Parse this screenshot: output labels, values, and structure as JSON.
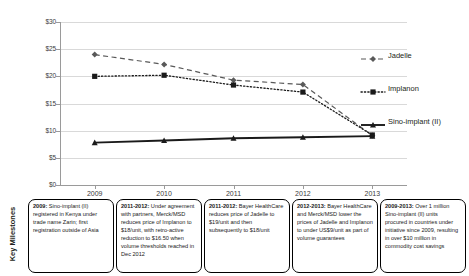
{
  "chart_data": {
    "type": "line",
    "title": "",
    "xlabel": "",
    "ylabel": "",
    "categories": [
      "2009",
      "2010",
      "2011",
      "2012",
      "2013"
    ],
    "ylim": [
      0,
      30
    ],
    "ytick_labels": [
      "$0",
      "$5",
      "$10",
      "$15",
      "$20",
      "$25",
      "$30"
    ],
    "ytick_values": [
      0,
      5,
      10,
      15,
      20,
      25,
      30
    ],
    "grid": true,
    "legend_position": "right",
    "currency": "USD per unit",
    "series": [
      {
        "name": "Jadelle",
        "values": [
          24.0,
          22.2,
          19.3,
          18.5,
          9.1
        ],
        "style": "dashed",
        "marker": "diamond",
        "color": "#595959"
      },
      {
        "name": "Implanon",
        "values": [
          20.0,
          20.2,
          18.4,
          17.1,
          9.2
        ],
        "style": "dotted",
        "marker": "square",
        "color": "#1a1a1a"
      },
      {
        "name": "Sino-implant (II)",
        "values": [
          7.8,
          8.2,
          8.6,
          8.8,
          9.0
        ],
        "style": "solid",
        "marker": "triangle",
        "color": "#1a1a1a"
      }
    ]
  },
  "legend": {
    "items": [
      {
        "label": "Jadelle"
      },
      {
        "label": "Implanon"
      },
      {
        "label": "Sino-implant (II)"
      }
    ]
  },
  "milestones": {
    "axis_label": "Key Milestones",
    "boxes": [
      {
        "period": "2009:",
        "text": " Sino-implant (II) registered in Kenya under trade name Zarin; first registration outside of Asia"
      },
      {
        "period": "2011-2012:",
        "text": "  Under agreement with partners, Merck/MSD reduces price of Implanon to $18/unit, with retro-active reduction to $16.50 when volume thresholds reached in Dec 2012"
      },
      {
        "period": "2011-2012:",
        "text": "  Bayer HealthCare reduces price of Jadelle to $19/unit and then subsequently to $18/unit"
      },
      {
        "period": "2012-2013:",
        "text": "  Bayer HealthCare and Merck/MSD lower the prices of Jadelle and Implanon to under US$9/unit as part of volume guarantees"
      },
      {
        "period": "2009-2013:",
        "text": "  Over 1 million Sino-implant (II) units procured in countries under initiative since 2009, resulting in over $10 million in commodity cost savings"
      }
    ]
  }
}
